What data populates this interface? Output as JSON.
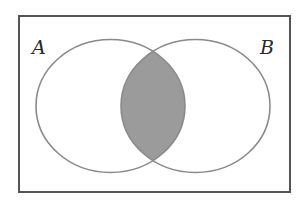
{
  "diagram": {
    "type": "venn",
    "universe": {
      "x": 19,
      "y": 16,
      "width": 271,
      "height": 176,
      "stroke": "#555555",
      "stroke_width": 2
    },
    "sets": [
      {
        "label": "A",
        "cx": 110.5,
        "cy": 106,
        "rx": 74.5,
        "ry": 66.5,
        "stroke": "#8a8a8a",
        "label_x": 32,
        "label_y": 54
      },
      {
        "label": "B",
        "cx": 195.5,
        "cy": 106,
        "rx": 74.5,
        "ry": 66.5,
        "stroke": "#8a8a8a",
        "label_x": 260,
        "label_y": 54
      }
    ],
    "shaded_region": "A ∩ B",
    "shade_color": "#9b9b9b"
  }
}
